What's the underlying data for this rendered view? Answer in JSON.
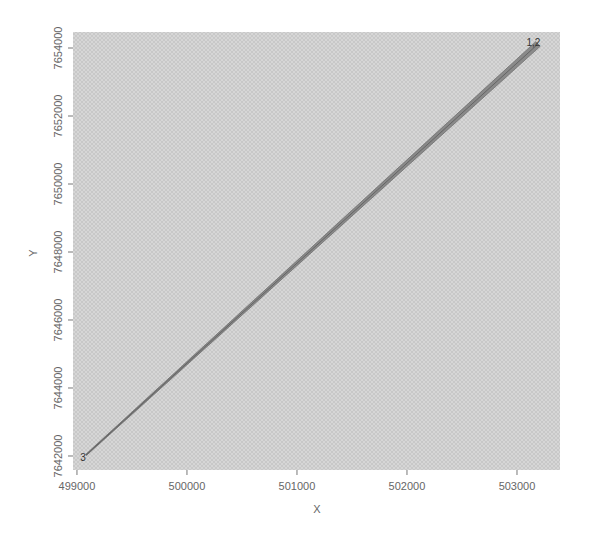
{
  "chart_data": {
    "type": "line",
    "title": "",
    "xlabel": "X",
    "ylabel": "Y",
    "xlim": [
      498964,
      503391
    ],
    "ylim": [
      7641588,
      7654471
    ],
    "x_ticks": [
      499000,
      500000,
      501000,
      502000,
      503000
    ],
    "x_tick_labels": [
      "499000",
      "500000",
      "501000",
      "502000",
      "503000"
    ],
    "y_ticks": [
      7642000,
      7644000,
      7646000,
      7648000,
      7650000,
      7652000,
      7654000
    ],
    "y_tick_labels": [
      "7642000",
      "7644000",
      "7646000",
      "7648000",
      "7650000",
      "7652000",
      "7654000"
    ],
    "grid": false,
    "background": "hatched light gray",
    "series": [
      {
        "name": "transect band",
        "points": [
          {
            "x": 499082,
            "y": 7642029
          },
          {
            "x": 503191,
            "y": 7654118
          }
        ],
        "color": "#6e6e6e",
        "fill": "#8a8a8a"
      }
    ],
    "annotations": [
      {
        "text": "3",
        "x": 499055,
        "y": 7641970
      },
      {
        "text": "1,2",
        "x": 503150,
        "y": 7654180
      }
    ]
  },
  "colors": {
    "plot_bg": "#d4d4d4",
    "hatch": "#c4c4c4",
    "line": "#6e6e6e",
    "band_fill": "#8c8c8c",
    "axis": "#777777"
  }
}
